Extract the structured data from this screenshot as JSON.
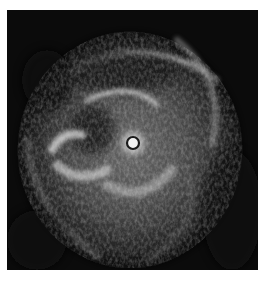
{
  "image": {
    "kind": "intravascular ultrasound cross-section",
    "modality": "grayscale",
    "background_color": "#0b0b0b",
    "border_color": "#ffffff",
    "catheter": {
      "cx": 126,
      "cy": 133,
      "r": 6,
      "ring_color": "#1a1a1a",
      "core_color": "#f2f2f2"
    }
  }
}
